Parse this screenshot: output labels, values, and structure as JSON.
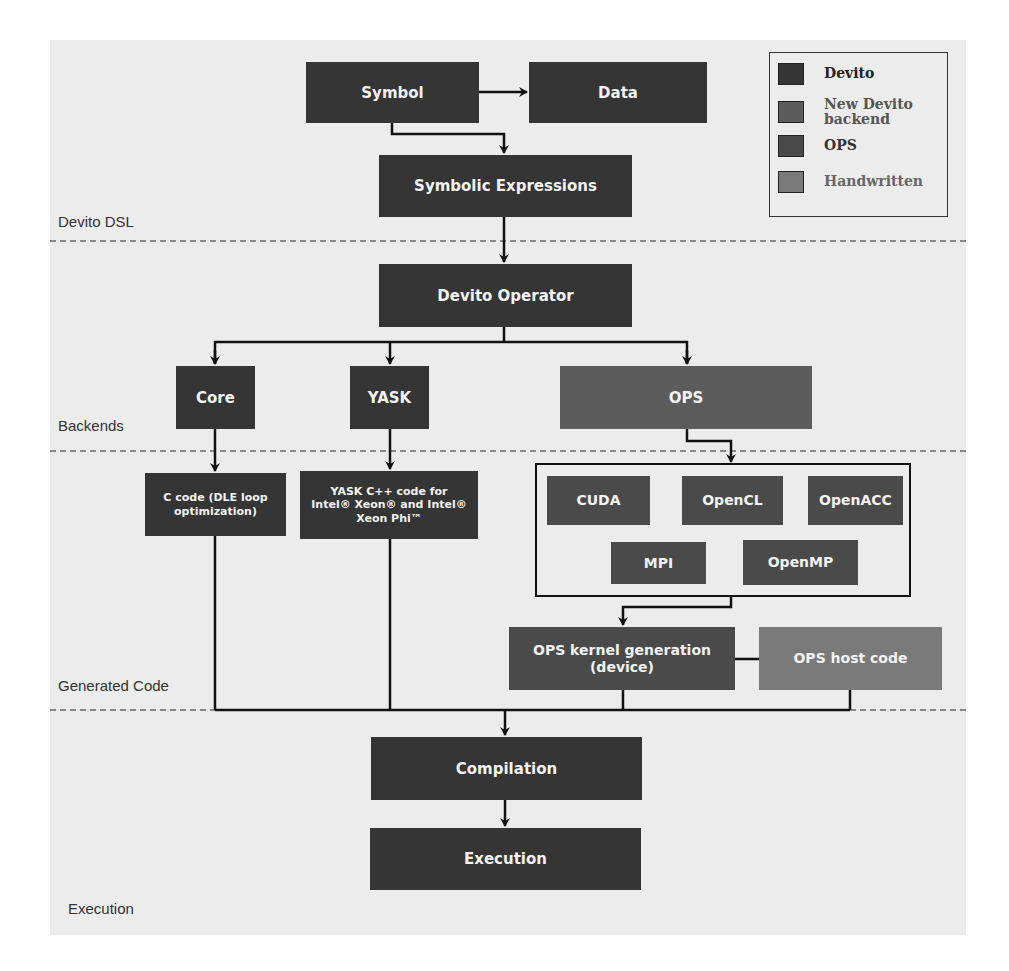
{
  "layers": {
    "dsl": "Devito DSL",
    "backends": "Backends",
    "generated": "Generated Code",
    "execution": "Execution"
  },
  "legend": {
    "items": [
      {
        "label": "Devito",
        "color": "#353535"
      },
      {
        "label": "New Devito backend",
        "color": "#5c5c5c"
      },
      {
        "label": "OPS",
        "color": "#4a4a4a"
      },
      {
        "label": "Handwritten",
        "color": "#7a7a7a"
      }
    ]
  },
  "nodes": {
    "symbol": "Symbol",
    "data": "Data",
    "symbolic_expressions": "Symbolic Expressions",
    "devito_operator": "Devito Operator",
    "core": "Core",
    "yask": "YASK",
    "ops": "OPS",
    "c_code": "C code (DLE loop optimization)",
    "yask_code": "YASK C++ code for Intel® Xeon® and Intel® Xeon Phi™",
    "cuda": "CUDA",
    "opencl": "OpenCL",
    "openacc": "OpenACC",
    "mpi": "MPI",
    "openmp": "OpenMP",
    "ops_kernel": "OPS kernel generation (device)",
    "ops_host": "OPS host code",
    "compilation": "Compilation",
    "execution": "Execution"
  }
}
